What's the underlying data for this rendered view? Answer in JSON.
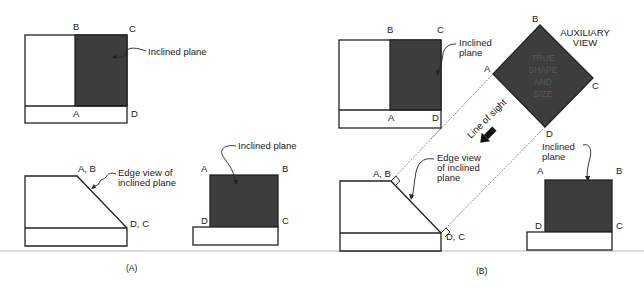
{
  "figure": {
    "panels": [
      {
        "id": "A",
        "caption": "(A)",
        "top_view": {
          "vertex_labels": {
            "A": "A",
            "B": "B",
            "C": "C",
            "D": "D"
          },
          "callout": "Inclined plane"
        },
        "front_view": {
          "vertex_labels": {
            "top": "A, B",
            "bottom": "D, C"
          },
          "callout_line1": "Edge view of",
          "callout_line2": "inclined plane"
        },
        "side_view": {
          "vertex_labels": {
            "A": "A",
            "B": "B",
            "C": "C",
            "D": "D"
          },
          "callout": "Inclined plane"
        }
      },
      {
        "id": "B",
        "caption": "(B)",
        "top_view": {
          "vertex_labels": {
            "A": "A",
            "B": "B",
            "C": "C",
            "D": "D"
          },
          "callout_line1": "Inclined",
          "callout_line2": "plane"
        },
        "auxiliary_view": {
          "title_line1": "AUXILIARY",
          "title_line2": "VIEW",
          "vertex_labels": {
            "A": "A",
            "B": "B",
            "C": "C",
            "D": "D"
          },
          "inner_text": [
            "TRUE",
            "SHAPE",
            "AND",
            "SIZE"
          ]
        },
        "line_of_sight": "Line of sight",
        "front_view": {
          "vertex_labels": {
            "top": "A, B",
            "bottom": "D, C"
          },
          "callout_line1": "Edge view",
          "callout_line2": "of inclined",
          "callout_line3": "plane"
        },
        "side_view": {
          "vertex_labels": {
            "A": "A",
            "B": "B",
            "C": "C",
            "D": "D"
          },
          "callout_line1": "Inclined",
          "callout_line2": "plane"
        }
      }
    ],
    "colors": {
      "plane_fill": "#3d3d3d",
      "line": "#222222",
      "rule": "#c8c8c8"
    }
  }
}
